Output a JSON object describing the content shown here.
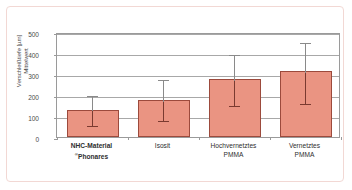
{
  "chart_data": {
    "type": "bar",
    "title": "",
    "xlabel": "",
    "ylabel_line1": "Verschleißtiefe [µm]",
    "ylabel_line2": "Mittelwert",
    "ylim": [
      0,
      500
    ],
    "yticks": [
      0,
      100,
      200,
      300,
      400,
      500
    ],
    "ytick_labels": [
      "0",
      "100",
      "200",
      "300",
      "400",
      "500"
    ],
    "grid": true,
    "legend": "none",
    "categories": [
      "NHC-Material ®Phonares",
      "Isosit",
      "Hochvernetztes PMMA",
      "Vernetztes PMMA"
    ],
    "category_labels": [
      {
        "line1": "NHC-Material",
        "sup": "®",
        "line2": "Phonares",
        "bold": true
      },
      {
        "line1": "Isosit",
        "sup": "",
        "line2": "",
        "bold": false
      },
      {
        "line1": "Hochvernetztes",
        "sup": "",
        "line2": "PMMA",
        "bold": false
      },
      {
        "line1": "Vernetztes",
        "sup": "",
        "line2": "PMMA",
        "bold": false
      }
    ],
    "values": [
      131,
      178,
      277,
      314
    ],
    "error_upper": [
      203,
      283,
      398,
      457
    ],
    "error_lower": [
      63,
      87,
      155,
      165
    ],
    "bar_color": "#ea9482",
    "bar_edge_color": "#9c4a3c",
    "error_color": "#7a3a30",
    "error_upper_color": "#8a8a8a",
    "grid_color": "#a8a8a8",
    "axis_color": "#9a9a9a",
    "frame_color": "#f2d8d4"
  }
}
